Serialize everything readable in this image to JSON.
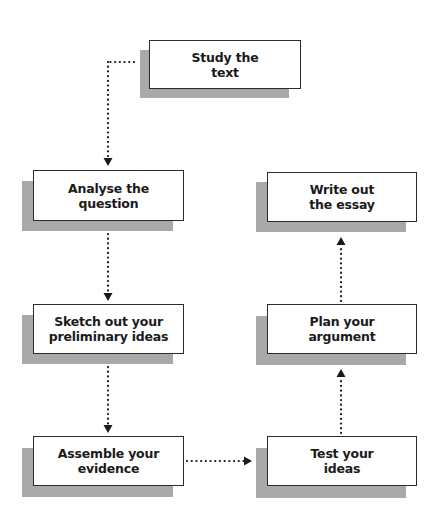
{
  "diagram": {
    "type": "flowchart",
    "colors": {
      "box_fill": "#ffffff",
      "box_border": "#2b2b2b",
      "shadow": "#a9a9a9",
      "connector": "#1a1a1a",
      "background": "#ffffff"
    },
    "nodes": [
      {
        "id": "study",
        "label": "Study the\ntext"
      },
      {
        "id": "analyse",
        "label": "Analyse the\nquestion"
      },
      {
        "id": "sketch",
        "label": "Sketch out your\npreliminary ideas"
      },
      {
        "id": "assemble",
        "label": "Assemble your\nevidence"
      },
      {
        "id": "test",
        "label": "Test your\nideas"
      },
      {
        "id": "plan",
        "label": "Plan your\nargument"
      },
      {
        "id": "write",
        "label": "Write out\nthe essay"
      }
    ],
    "edges": [
      {
        "from": "study",
        "to": "analyse",
        "style": "dotted"
      },
      {
        "from": "analyse",
        "to": "sketch",
        "style": "dotted"
      },
      {
        "from": "sketch",
        "to": "assemble",
        "style": "dotted"
      },
      {
        "from": "assemble",
        "to": "test",
        "style": "dotted"
      },
      {
        "from": "test",
        "to": "plan",
        "style": "dotted"
      },
      {
        "from": "plan",
        "to": "write",
        "style": "dotted"
      }
    ]
  }
}
